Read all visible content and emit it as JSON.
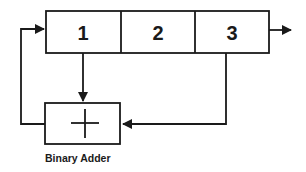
{
  "diagram": {
    "type": "shift-register-feedback",
    "register": {
      "cells": [
        {
          "label": "1"
        },
        {
          "label": "2"
        },
        {
          "label": "3"
        }
      ]
    },
    "adder": {
      "symbol": "+",
      "caption": "Binary Adder"
    },
    "connections": [
      {
        "from": "cell-1",
        "to": "adder",
        "kind": "arrow"
      },
      {
        "from": "cell-3",
        "to": "adder",
        "kind": "arrow"
      },
      {
        "from": "adder",
        "to": "cell-1",
        "kind": "arrow-feedback"
      },
      {
        "from": "cell-3",
        "to": "output",
        "kind": "arrow"
      }
    ],
    "colors": {
      "line": "#1a1a1a",
      "background": "#ffffff"
    }
  }
}
